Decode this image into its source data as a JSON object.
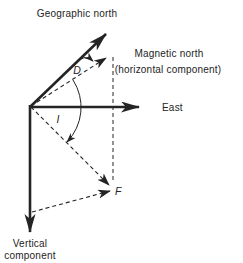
{
  "figure": {
    "colors": {
      "ink": "#242424",
      "background": "#ffffff"
    },
    "labels": {
      "geographic_north": "Geographic north",
      "magnetic_north": "Magnetic north",
      "magnetic_north_sub": "(horizontal component)",
      "east": "East",
      "vertical_component_line1": "Vertical",
      "vertical_component_line2": "component",
      "declination_angle": "D",
      "inclination_angle": "I",
      "total_field": "F"
    }
  }
}
